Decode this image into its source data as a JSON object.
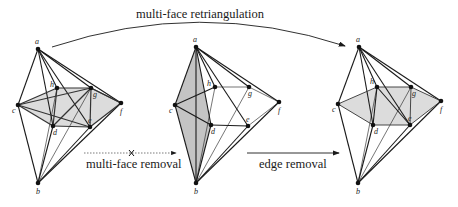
{
  "title": "multi-face retriangulation",
  "operations": {
    "top_arrow": "multi-face retriangulation",
    "left_arrow": "multi-face removal",
    "right_arrow": "edge removal",
    "left_arrow_marker": "cross-icon"
  },
  "graphs": [
    {
      "id": "graph-before",
      "nodes": [
        {
          "id": "a",
          "x": 38,
          "y": 49
        },
        {
          "id": "h",
          "x": 57,
          "y": 88
        },
        {
          "id": "g",
          "x": 91,
          "y": 88
        },
        {
          "id": "c",
          "x": 18,
          "y": 105
        },
        {
          "id": "f",
          "x": 121,
          "y": 103
        },
        {
          "id": "d",
          "x": 53,
          "y": 126
        },
        {
          "id": "e",
          "x": 90,
          "y": 127
        },
        {
          "id": "b",
          "x": 38,
          "y": 183
        }
      ],
      "shaded_region": [
        "c",
        "h",
        "g",
        "f",
        "e",
        "d"
      ]
    },
    {
      "id": "graph-middle",
      "nodes": [
        {
          "id": "a",
          "x": 196,
          "y": 47
        },
        {
          "id": "h",
          "x": 215,
          "y": 87
        },
        {
          "id": "g",
          "x": 249,
          "y": 87
        },
        {
          "id": "c",
          "x": 175,
          "y": 105
        },
        {
          "id": "f",
          "x": 279,
          "y": 102
        },
        {
          "id": "d",
          "x": 211,
          "y": 125
        },
        {
          "id": "e",
          "x": 248,
          "y": 126
        },
        {
          "id": "b",
          "x": 196,
          "y": 183
        }
      ],
      "shaded_region": [
        "a",
        "c",
        "b",
        "d"
      ]
    },
    {
      "id": "graph-after",
      "nodes": [
        {
          "id": "a",
          "x": 359,
          "y": 47
        },
        {
          "id": "h",
          "x": 377,
          "y": 87
        },
        {
          "id": "g",
          "x": 411,
          "y": 87
        },
        {
          "id": "c",
          "x": 338,
          "y": 104
        },
        {
          "id": "f",
          "x": 441,
          "y": 101
        },
        {
          "id": "d",
          "x": 373,
          "y": 125
        },
        {
          "id": "e",
          "x": 410,
          "y": 125
        },
        {
          "id": "b",
          "x": 358,
          "y": 183
        }
      ],
      "shaded_region": [
        "c",
        "h",
        "g",
        "f",
        "e",
        "d"
      ]
    }
  ],
  "colors": {
    "shade": "#d9d9d9",
    "shade_dark": "#b8b8b8",
    "edge": "#1a1a1a",
    "node": "#111111"
  }
}
